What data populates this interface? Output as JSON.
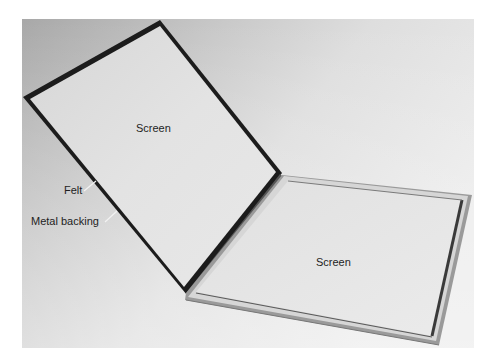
{
  "figure": {
    "labels": {
      "lid_screen": "Screen",
      "tray_screen": "Screen",
      "felt": "Felt",
      "metal_backing": "Metal backing"
    }
  },
  "colors": {
    "background_dark": "#a9a9a9",
    "background_light": "#e4e4e4",
    "screen": "#e2e2e2",
    "frame": "#1c1c1c",
    "rim_light": "#d8d8d8",
    "text": "#1e1e1e"
  }
}
